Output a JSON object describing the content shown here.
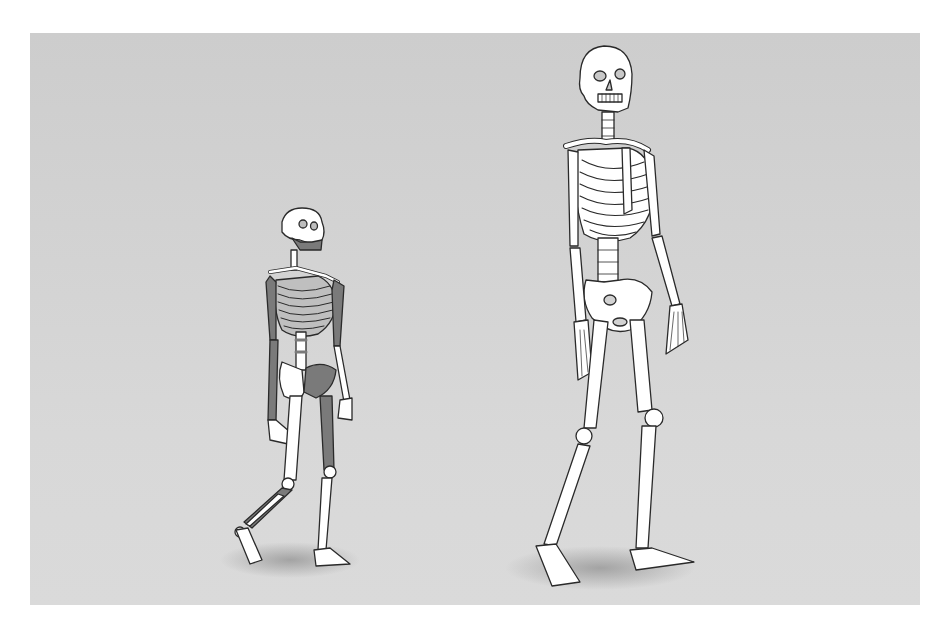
{
  "figure": {
    "background_color": "#d2d2d2",
    "bone_color": "#ffffff",
    "fossil_bone_color": "#7a7a7a",
    "outline_color": "#2a2a2a",
    "shadow_color": "#9a9a9a"
  },
  "skeletons": [
    {
      "id": "small-hominin",
      "label": "Small hominin skeleton (partial fossil, darker bones shown)",
      "height_px": 330,
      "position_x": 300
    },
    {
      "id": "modern-human",
      "label": "Modern human skeleton",
      "height_px": 545,
      "position_x": 615
    }
  ]
}
